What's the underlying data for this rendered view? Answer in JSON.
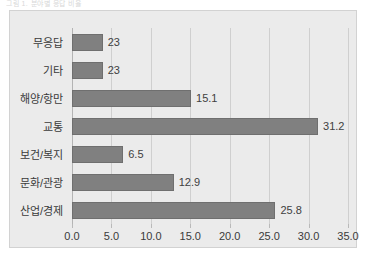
{
  "figure": {
    "title_remnant": "그림 1. 분야별 응답 비율",
    "plot_background": "#ebebeb",
    "page_background": "#ffffff",
    "bar_color": "#808080",
    "bar_edge_color": "#6f6f6f",
    "gridline_color": "#cfcfcf",
    "text_color": "#3a3a3a"
  },
  "chart_data": {
    "type": "bar",
    "orientation": "horizontal",
    "title": "",
    "xlabel": "",
    "ylabel": "",
    "categories": [
      "산업/경제",
      "문화/관광",
      "보건/복지",
      "교통",
      "해양/항만",
      "기타",
      "무응답"
    ],
    "values": [
      25.8,
      12.9,
      6.5,
      31.2,
      15.1,
      3.9,
      3.9
    ],
    "value_labels": [
      "25.8",
      "12.9",
      "6.5",
      "31.2",
      "15.1",
      "23",
      "23"
    ],
    "xlim": [
      0.0,
      35.0
    ],
    "xticks": [
      0.0,
      5.0,
      10.0,
      15.0,
      20.0,
      25.0,
      30.0,
      35.0
    ],
    "xtick_labels": [
      "0.0",
      "5.0",
      "10.0",
      "15.0",
      "20.0",
      "25.0",
      "30.0",
      "35.0"
    ],
    "grid": true,
    "grid_axis": "x",
    "legend": false,
    "legend_position": "none",
    "series": [
      {
        "name": "비율",
        "values": [
          25.8,
          12.9,
          6.5,
          31.2,
          15.1,
          3.9,
          3.9
        ]
      }
    ]
  }
}
